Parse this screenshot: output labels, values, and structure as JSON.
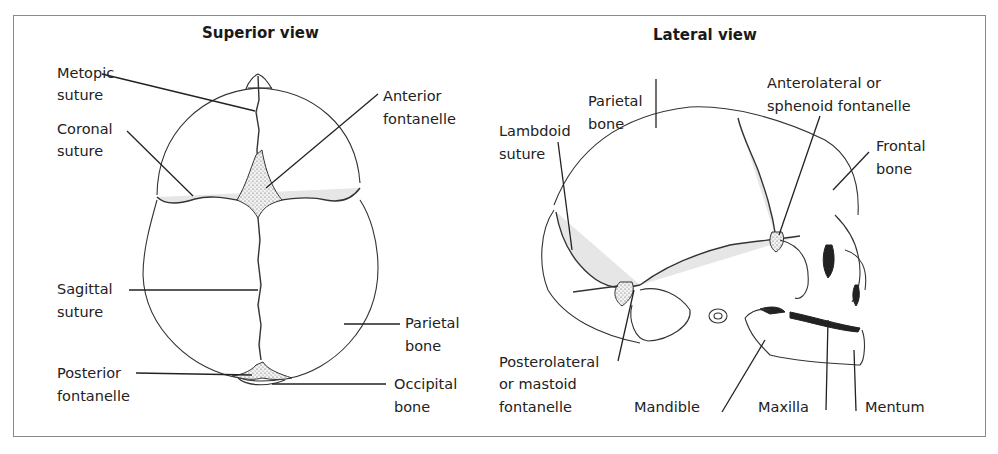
{
  "figure": {
    "panels": [
      {
        "title": "Superior view",
        "labels": [
          {
            "line1": "Metopic",
            "line2": "suture"
          },
          {
            "line1": "Coronal",
            "line2": "suture"
          },
          {
            "line1": "Anterior",
            "line2": "fontanelle"
          },
          {
            "line1": "Sagittal",
            "line2": "suture"
          },
          {
            "line1": "Parietal",
            "line2": "bone"
          },
          {
            "line1": "Posterior",
            "line2": "fontanelle"
          },
          {
            "line1": "Occipital",
            "line2": "bone"
          }
        ]
      },
      {
        "title": "Lateral view",
        "labels": [
          {
            "line1": "Parietal",
            "line2": "bone"
          },
          {
            "line1": "Anterolateral or",
            "line2": "sphenoid fontanelle"
          },
          {
            "line1": "Lambdoid",
            "line2": "suture"
          },
          {
            "line1": "Frontal",
            "line2": "bone"
          },
          {
            "line1": "Posterolateral",
            "line2": "or mastoid",
            "line3": "fontanelle"
          },
          {
            "line1": "Mandible"
          },
          {
            "line1": "Maxilla"
          },
          {
            "line1": "Mentum"
          }
        ]
      }
    ]
  }
}
